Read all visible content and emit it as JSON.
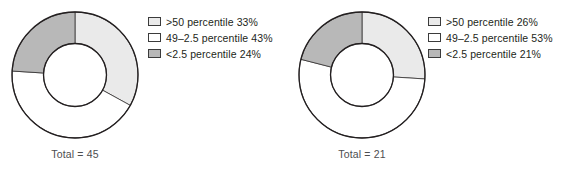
{
  "figure": {
    "panels": [
      {
        "id": "left",
        "total_label": "Total = 45",
        "legend": [
          {
            "label": ">50 percentile 33%",
            "color": "#eaeaea"
          },
          {
            "label": "49–2.5 percentile 43%",
            "color": "#ffffff"
          },
          {
            "label": "<2.5 percentile 24%",
            "color": "#b8b8b8"
          }
        ]
      },
      {
        "id": "right",
        "total_label": "Total = 21",
        "legend": [
          {
            "label": ">50 percentile 26%",
            "color": "#eaeaea"
          },
          {
            "label": "49–2.5 percentile 53%",
            "color": "#ffffff"
          },
          {
            "label": "<2.5 percentile 21%",
            "color": "#b8b8b8"
          }
        ]
      }
    ]
  },
  "chart_data": [
    {
      "type": "pie",
      "variant": "donut",
      "title": "",
      "total_label": "Total = 45",
      "total": 45,
      "categories": [
        ">50 percentile",
        "49–2.5 percentile",
        "<2.5 percentile"
      ],
      "values": [
        33,
        43,
        24
      ],
      "value_unit": "percent",
      "colors": [
        "#eaeaea",
        "#ffffff",
        "#b8b8b8"
      ],
      "stroke": "#231f20",
      "start_angle_deg": 0,
      "direction": "clockwise",
      "inner_radius_ratio": 0.5,
      "legend_position": "right"
    },
    {
      "type": "pie",
      "variant": "donut",
      "title": "",
      "total_label": "Total = 21",
      "total": 21,
      "categories": [
        ">50 percentile",
        "49–2.5 percentile",
        "<2.5 percentile"
      ],
      "values": [
        26,
        53,
        21
      ],
      "value_unit": "percent",
      "colors": [
        "#eaeaea",
        "#ffffff",
        "#b8b8b8"
      ],
      "stroke": "#231f20",
      "start_angle_deg": 0,
      "direction": "clockwise",
      "inner_radius_ratio": 0.5,
      "legend_position": "right"
    }
  ]
}
